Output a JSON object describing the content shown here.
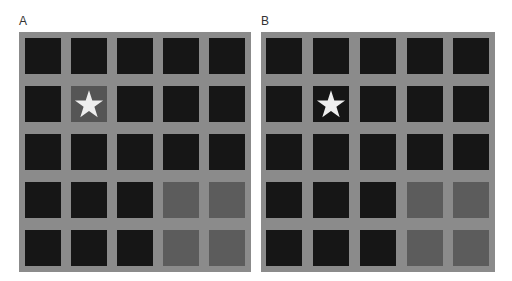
{
  "figure": {
    "panels": [
      {
        "label": "A",
        "grid_rows": 5,
        "grid_cols": 5,
        "star_cell": {
          "row": 1,
          "col": 1
        },
        "cells": [
          [
            "black",
            "black",
            "black",
            "black",
            "black"
          ],
          [
            "black",
            "highlight",
            "black",
            "black",
            "black"
          ],
          [
            "black",
            "black",
            "black",
            "black",
            "black"
          ],
          [
            "black",
            "black",
            "black",
            "gray",
            "gray"
          ],
          [
            "black",
            "black",
            "black",
            "gray",
            "gray"
          ]
        ]
      },
      {
        "label": "B",
        "grid_rows": 5,
        "grid_cols": 5,
        "star_cell": {
          "row": 1,
          "col": 1
        },
        "cells": [
          [
            "black",
            "black",
            "black",
            "black",
            "black"
          ],
          [
            "black",
            "black",
            "black",
            "black",
            "black"
          ],
          [
            "black",
            "black",
            "black",
            "black",
            "black"
          ],
          [
            "black",
            "black",
            "black",
            "gray",
            "gray"
          ],
          [
            "black",
            "black",
            "black",
            "gray",
            "gray"
          ]
        ]
      }
    ],
    "colors": {
      "background": "#8b8b8b",
      "black_cell": "#161616",
      "gray_cell": "#5c5c5c",
      "highlight_cell": "#555555",
      "star": "#eeeeee"
    },
    "icons": {
      "marker": "star-icon"
    }
  }
}
